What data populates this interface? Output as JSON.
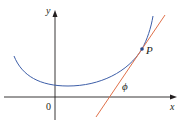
{
  "figure": {
    "labels": {
      "y_axis": "y",
      "x_axis": "x",
      "origin": "0",
      "point": "P",
      "angle": "ϕ"
    },
    "colors": {
      "axes": "#231f20",
      "curve": "#3d5ea8",
      "tangent": "#e0714a",
      "point": "#2a4a8a"
    }
  }
}
